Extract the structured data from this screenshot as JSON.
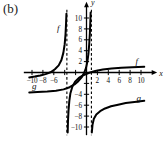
{
  "panel": {
    "label": "(b)"
  },
  "chart_data": {
    "type": "line",
    "title": "",
    "xlabel": "x",
    "ylabel": "y",
    "xlim": [
      -11.5,
      11.5
    ],
    "ylim": [
      -11.5,
      11.5
    ],
    "grid": false,
    "legend": "inline-curve-labels",
    "x_ticks": [
      -10,
      -8,
      -6,
      -4,
      -2,
      2,
      4,
      6,
      8,
      10
    ],
    "x_tick_labels": [
      "-10",
      "-8",
      "-6",
      "",
      "",
      "2",
      "4",
      "6",
      "8",
      "10"
    ],
    "y_ticks": [
      -10,
      -8,
      -6,
      -4,
      -2,
      2,
      4,
      6,
      8,
      10
    ],
    "y_tick_labels": [
      "-10",
      "-8",
      "-6",
      "-4",
      "",
      "2",
      "4",
      "6",
      "8",
      "10"
    ],
    "annotations": [
      {
        "text": "f",
        "x": -5.2,
        "y": 7.6
      },
      {
        "text": "f",
        "x": 9.2,
        "y": 1.5
      },
      {
        "text": "g",
        "x": -9.6,
        "y": -3.1
      },
      {
        "text": "g",
        "x": 9.6,
        "y": -5.2
      }
    ],
    "asymptotes": [
      {
        "orientation": "vertical",
        "x": -3.6,
        "style": "dashed",
        "belongs_to": "f"
      },
      {
        "orientation": "vertical",
        "x": 0.9,
        "style": "dashed",
        "belongs_to": "g"
      }
    ],
    "series": [
      {
        "name": "f",
        "style": "solid",
        "description": "Increasing curve with vertical asymptote at x = -3.6; left branch rises from y = -1 near x = -10.5 to +infinity; right branch rises from -infinity up through the origin region and flattens toward y = 1 as x increases to 10.5",
        "branches": [
          {
            "points": [
              [
                -10.5,
                -0.9
              ],
              [
                -9.5,
                -0.75
              ],
              [
                -8.5,
                -0.55
              ],
              [
                -7.5,
                -0.3
              ],
              [
                -6.6,
                0.05
              ],
              [
                -5.8,
                0.6
              ],
              [
                -5.1,
                1.3
              ],
              [
                -4.6,
                2.3
              ],
              [
                -4.25,
                3.6
              ],
              [
                -4.0,
                5.2
              ],
              [
                -3.85,
                7.0
              ],
              [
                -3.75,
                9.0
              ],
              [
                -3.68,
                10.8
              ]
            ]
          },
          {
            "points": [
              [
                -3.45,
                -11.0
              ],
              [
                -3.4,
                -9.0
              ],
              [
                -3.3,
                -7.0
              ],
              [
                -3.15,
                -5.2
              ],
              [
                -2.95,
                -3.8
              ],
              [
                -2.6,
                -2.6
              ],
              [
                -2.1,
                -1.7
              ],
              [
                -1.4,
                -1.0
              ],
              [
                -0.5,
                -0.45
              ],
              [
                0.5,
                -0.05
              ],
              [
                1.6,
                0.28
              ],
              [
                3.0,
                0.55
              ],
              [
                4.6,
                0.75
              ],
              [
                6.4,
                0.88
              ],
              [
                8.4,
                0.97
              ],
              [
                10.6,
                1.05
              ]
            ]
          }
        ]
      },
      {
        "name": "g",
        "style": "solid",
        "description": "Increasing curve with vertical asymptote at x = 0.9; left branch rises from y = -3.6 near x = -10.5 up through the origin region toward +infinity; right branch rises from -infinity near x = 1 to about y = -5.2 at x = 10.5",
        "branches": [
          {
            "points": [
              [
                -10.5,
                -3.65
              ],
              [
                -9.0,
                -3.6
              ],
              [
                -7.2,
                -3.5
              ],
              [
                -5.6,
                -3.35
              ],
              [
                -4.2,
                -3.1
              ],
              [
                -3.1,
                -2.7
              ],
              [
                -2.2,
                -2.2
              ],
              [
                -1.5,
                -1.6
              ],
              [
                -0.9,
                -0.9
              ],
              [
                -0.45,
                -0.1
              ],
              [
                -0.1,
                0.8
              ],
              [
                0.15,
                1.9
              ],
              [
                0.35,
                3.4
              ],
              [
                0.5,
                5.2
              ],
              [
                0.62,
                7.2
              ],
              [
                0.7,
                9.2
              ],
              [
                0.76,
                11.0
              ]
            ]
          },
          {
            "points": [
              [
                0.98,
                -11.0
              ],
              [
                1.1,
                -9.6
              ],
              [
                1.35,
                -8.5
              ],
              [
                1.8,
                -7.7
              ],
              [
                2.5,
                -7.1
              ],
              [
                3.4,
                -6.6
              ],
              [
                4.5,
                -6.2
              ],
              [
                5.8,
                -5.9
              ],
              [
                7.2,
                -5.6
              ],
              [
                8.8,
                -5.4
              ],
              [
                10.6,
                -5.2
              ]
            ]
          }
        ]
      }
    ]
  }
}
